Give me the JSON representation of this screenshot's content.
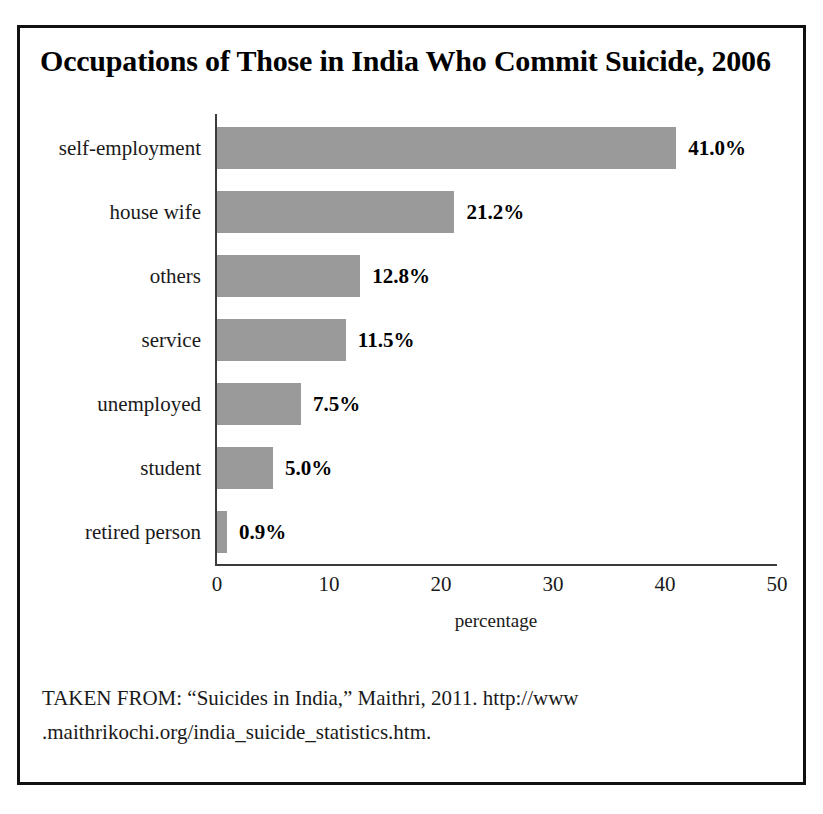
{
  "figure": {
    "title": "Occupations of Those in India Who Commit Suicide, 2006",
    "source_line_1": "TAKEN FROM: “Suicides in India,” Maithri, 2011. http://www",
    "source_line_2": ".maithrikochi.org/india_suicide_statistics.htm.",
    "bar_color": "#9a9a9a",
    "frame_color": "#111111",
    "axis_color": "#3b3b3b",
    "background_color": "#ffffff"
  },
  "chart_data": {
    "type": "bar",
    "orientation": "horizontal",
    "title": "Occupations of Those in India Who Commit Suicide, 2006",
    "xlabel": "percentage",
    "ylabel": "",
    "xlim": [
      0,
      50
    ],
    "xticks": [
      "0",
      "10",
      "20",
      "30",
      "40",
      "50"
    ],
    "grid": false,
    "legend": false,
    "categories": [
      "self-employment",
      "house wife",
      "others",
      "service",
      "unemployed",
      "student",
      "retired person"
    ],
    "values": [
      41.0,
      21.2,
      12.8,
      11.5,
      7.5,
      5.0,
      0.9
    ],
    "value_labels": [
      "41.0%",
      "21.2%",
      "12.8%",
      "11.5%",
      "7.5%",
      "5.0%",
      "0.9%"
    ]
  }
}
